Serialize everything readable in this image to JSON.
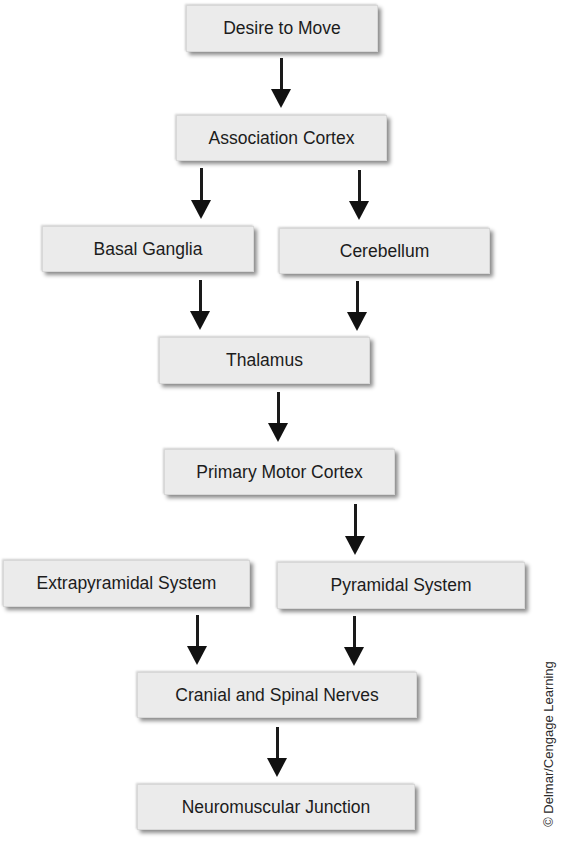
{
  "diagram": {
    "type": "flowchart",
    "direction": "top-to-bottom",
    "nodes": [
      {
        "id": "desire",
        "label": "Desire to Move"
      },
      {
        "id": "association",
        "label": "Association Cortex"
      },
      {
        "id": "basal",
        "label": "Basal Ganglia"
      },
      {
        "id": "cerebellum",
        "label": "Cerebellum"
      },
      {
        "id": "thalamus",
        "label": "Thalamus"
      },
      {
        "id": "pmc",
        "label": "Primary Motor Cortex"
      },
      {
        "id": "extrapyramidal",
        "label": "Extrapyramidal System"
      },
      {
        "id": "pyramidal",
        "label": "Pyramidal System"
      },
      {
        "id": "nerves",
        "label": "Cranial and Spinal Nerves"
      },
      {
        "id": "nmj",
        "label": "Neuromuscular Junction"
      }
    ],
    "edges": [
      {
        "from": "desire",
        "to": "association"
      },
      {
        "from": "association",
        "to": "basal"
      },
      {
        "from": "association",
        "to": "cerebellum"
      },
      {
        "from": "basal",
        "to": "thalamus"
      },
      {
        "from": "cerebellum",
        "to": "thalamus"
      },
      {
        "from": "thalamus",
        "to": "pmc"
      },
      {
        "from": "pmc",
        "to": "pyramidal"
      },
      {
        "from": "extrapyramidal",
        "to": "nerves"
      },
      {
        "from": "pyramidal",
        "to": "nerves"
      },
      {
        "from": "nerves",
        "to": "nmj"
      }
    ],
    "credit": "© Delmar/Cengage Learning"
  },
  "colors": {
    "box_fill": "#ebebeb",
    "text": "#1c1c1c",
    "arrow": "#111111",
    "background": "#ffffff"
  }
}
